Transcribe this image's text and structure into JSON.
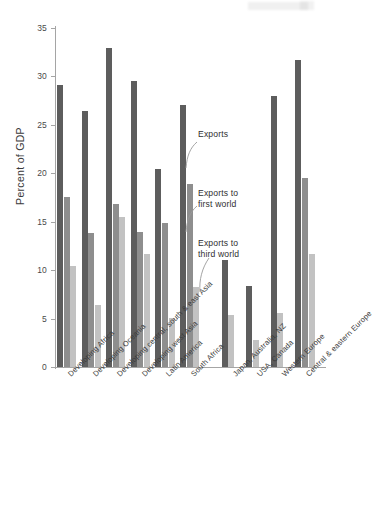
{
  "chart_data": {
    "type": "bar",
    "title": "",
    "xlabel": "",
    "ylabel": "Percent of GDP",
    "ylim": [
      0,
      35
    ],
    "yticks": [
      0,
      5,
      10,
      15,
      20,
      25,
      30,
      35
    ],
    "grid": false,
    "legend_position": "inline-annotations",
    "categories": [
      "Developing Africa",
      "Developing Oceania",
      "Developing central, south & east Asia",
      "Developing west Asia",
      "Latin America",
      "South Africa",
      "Japan, Australia, NZ",
      "USA, Canada",
      "Western Europe",
      "Central & eastern Europe"
    ],
    "series": [
      {
        "name": "Exports",
        "color": "#5d5d5d",
        "values": [
          29.1,
          26.4,
          32.9,
          29.5,
          20.4,
          27.1,
          11.0,
          8.4,
          28.0,
          31.7
        ]
      },
      {
        "name": "Exports to first world",
        "color": "#8e8e8e",
        "values": [
          17.6,
          13.8,
          16.8,
          13.9,
          14.9,
          18.9,
          null,
          null,
          null,
          19.5
        ]
      },
      {
        "name": "Exports to third world",
        "color": "#c2c2c2",
        "values": [
          10.4,
          6.4,
          15.5,
          11.7,
          5.1,
          8.3,
          5.4,
          2.8,
          5.6,
          11.7
        ]
      }
    ],
    "annotations": [
      {
        "text": "Exports",
        "series": "Exports"
      },
      {
        "text": "Exports to\nfirst world",
        "series": "Exports to first world"
      },
      {
        "text": "Exports to\nthird world",
        "series": "Exports to third world"
      }
    ]
  },
  "axis": {
    "y_title": "Percent of GDP",
    "tick_0": "0",
    "tick_5": "5",
    "tick_10": "10",
    "tick_15": "15",
    "tick_20": "20",
    "tick_25": "25",
    "tick_30": "30",
    "tick_35": "35"
  },
  "annotations": {
    "exports": "Exports",
    "first_world_l1": "Exports to",
    "first_world_l2": "first world",
    "third_world_l1": "Exports to",
    "third_world_l2": "third world"
  }
}
